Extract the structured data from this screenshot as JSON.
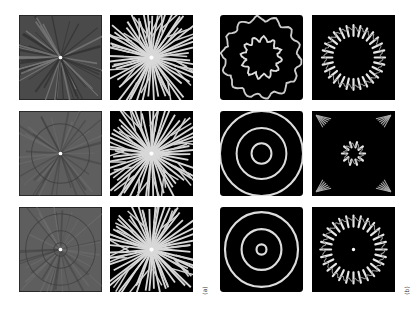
{
  "figure": {
    "labels": {
      "a": "(a)",
      "b": "(b)"
    },
    "panels": [
      {
        "id": "a-r1-c1",
        "group": "a",
        "row": 1,
        "col": 1,
        "style": "gray-radial-rays",
        "x": 19,
        "y": 15
      },
      {
        "id": "a-r1-c2",
        "group": "a",
        "row": 1,
        "col": 2,
        "style": "bw-radial-branches",
        "x": 110,
        "y": 15
      },
      {
        "id": "a-r2-c1",
        "group": "a",
        "row": 2,
        "col": 1,
        "style": "gray-rays-faint-ring",
        "x": 19,
        "y": 111
      },
      {
        "id": "a-r2-c2",
        "group": "a",
        "row": 2,
        "col": 2,
        "style": "bw-radial-branches",
        "x": 110,
        "y": 111
      },
      {
        "id": "a-r3-c1",
        "group": "a",
        "row": 3,
        "col": 1,
        "style": "gray-concentric-faint",
        "x": 19,
        "y": 207
      },
      {
        "id": "a-r3-c2",
        "group": "a",
        "row": 3,
        "col": 2,
        "style": "bw-radial-branches",
        "x": 110,
        "y": 207
      },
      {
        "id": "b-r1-c1",
        "group": "b",
        "row": 1,
        "col": 1,
        "style": "wavy-two-rings",
        "x": 220,
        "y": 15
      },
      {
        "id": "b-r1-c2",
        "group": "b",
        "row": 1,
        "col": 2,
        "style": "petal-ring",
        "x": 312,
        "y": 15
      },
      {
        "id": "b-r2-c1",
        "group": "b",
        "row": 2,
        "col": 1,
        "style": "three-rings",
        "x": 220,
        "y": 111
      },
      {
        "id": "b-r2-c2",
        "group": "b",
        "row": 2,
        "col": 2,
        "style": "small-petal-center",
        "x": 312,
        "y": 111
      },
      {
        "id": "b-r3-c1",
        "group": "b",
        "row": 3,
        "col": 1,
        "style": "three-rings-dot",
        "x": 220,
        "y": 207
      },
      {
        "id": "b-r3-c2",
        "group": "b",
        "row": 3,
        "col": 2,
        "style": "large-petal-dot",
        "x": 312,
        "y": 207
      }
    ]
  }
}
